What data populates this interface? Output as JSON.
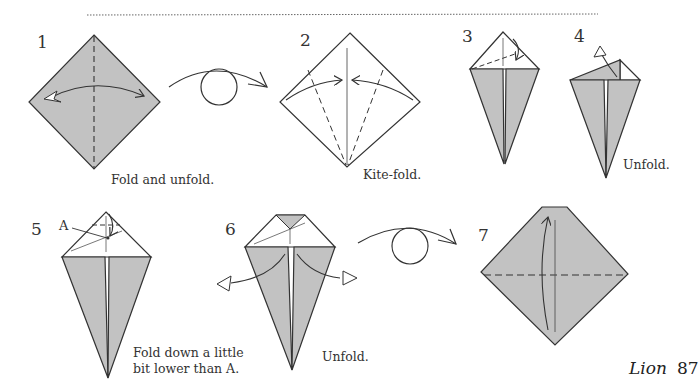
{
  "page": {
    "footer_title": "Lion",
    "page_number": "87"
  },
  "colors": {
    "paper_colored": "#c2c2c2",
    "paper_white": "#ffffff",
    "line": "#333333"
  },
  "steps": [
    {
      "number": "1",
      "caption": "Fold and unfold."
    },
    {
      "number": "2",
      "caption": "Kite-fold."
    },
    {
      "number": "3",
      "caption": ""
    },
    {
      "number": "4",
      "caption": "Unfold."
    },
    {
      "number": "5",
      "caption_line1": "Fold down a little",
      "caption_line2": "bit lower than A.",
      "reference_label": "A"
    },
    {
      "number": "6",
      "caption": "Unfold."
    },
    {
      "number": "7",
      "caption": ""
    }
  ],
  "symbols": [
    {
      "type": "turn-over-arrow",
      "between": [
        "1",
        "2"
      ]
    },
    {
      "type": "turn-over-arrow",
      "between": [
        "6",
        "7"
      ]
    }
  ]
}
